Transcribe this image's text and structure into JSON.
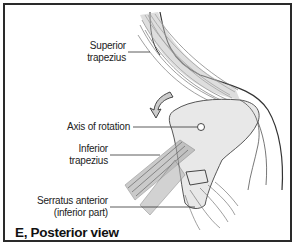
{
  "figure": {
    "caption": "E, Posterior view",
    "labels": {
      "superior_trapezius": [
        "Superior",
        "trapezius"
      ],
      "axis_of_rotation": "Axis of rotation",
      "inferior_trapezius": [
        "Inferior",
        "trapezius"
      ],
      "serratus_anterior": [
        "Serratus anterior",
        "(inferior part)"
      ]
    },
    "colors": {
      "border": "#2a2a2a",
      "muscle": "#8a8a8a",
      "bone": "#e6e6e6",
      "outline": "#333333"
    }
  }
}
